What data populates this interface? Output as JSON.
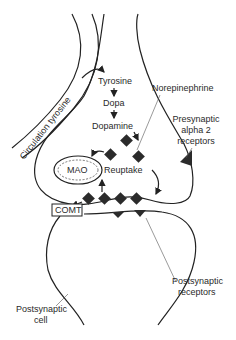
{
  "diagram": {
    "labels": {
      "circulation_tyrosine": "Circulation tyrosine",
      "tyrosine": "Tyrosine",
      "dopa": "Dopa",
      "dopamine": "Dopamine",
      "norepinephrine": "Norepinephrine",
      "presynaptic_alpha2_line1": "Presynaptic",
      "presynaptic_alpha2_line2": "alpha 2",
      "presynaptic_alpha2_line3": "receptors",
      "mao": "MAO",
      "reuptake": "Reuptake",
      "comt": "COMT",
      "postsynaptic_receptors_line1": "Postsynaptic",
      "postsynaptic_receptors_line2": "receptors",
      "postsynaptic_cell_line1": "Postsynaptic",
      "postsynaptic_cell_line2": "cell"
    },
    "pathway": [
      "Tyrosine",
      "Dopa",
      "Dopamine",
      "Norepinephrine"
    ],
    "colors": {
      "line": "#222222",
      "molecule": "#2b2b2b",
      "background": "#ffffff"
    }
  }
}
